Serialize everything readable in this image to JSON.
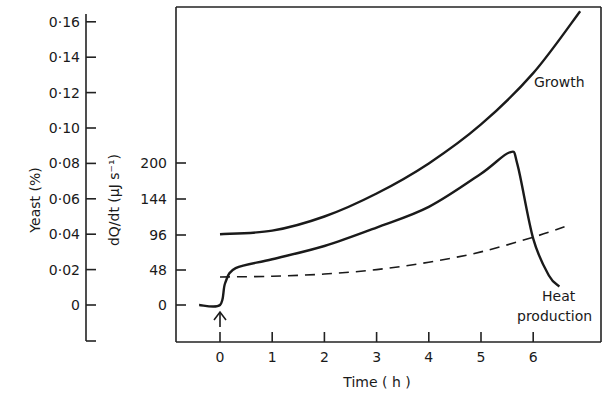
{
  "chart_data": {
    "type": "line",
    "title": "",
    "xlabel": "Time (h)",
    "x_ticks": [
      "0",
      "1",
      "2",
      "3",
      "4",
      "5",
      "6"
    ],
    "xlim": [
      -0.8,
      7.3
    ],
    "y_axes": [
      {
        "name": "yeast",
        "label": "Yeast (%)",
        "ticks": [
          "0·16",
          "0·14",
          "0·12",
          "0·10",
          "0·08",
          "0·06",
          "0·04",
          "0·02",
          "0"
        ],
        "ylim": [
          0,
          0.16
        ]
      },
      {
        "name": "heat",
        "label": "dQ/dt (μJ s⁻¹)",
        "ticks": [
          "200",
          "144",
          "96",
          "48",
          "0"
        ],
        "ylim": [
          0,
          200
        ]
      }
    ],
    "grid": false,
    "legend": "inline annotations",
    "series": [
      {
        "name": "Growth",
        "axis": "yeast",
        "style": "solid",
        "x": [
          0,
          1,
          2,
          3,
          4,
          5,
          6,
          6.9
        ],
        "values": [
          0.04,
          0.042,
          0.05,
          0.063,
          0.08,
          0.102,
          0.131,
          0.166
        ]
      },
      {
        "name": "Heat production",
        "axis": "heat",
        "style": "solid",
        "x": [
          -0.4,
          0,
          0.1,
          0.3,
          1,
          2,
          3,
          4,
          5,
          5.55,
          5.7,
          6.0,
          6.3,
          6.5
        ],
        "values": [
          0,
          0,
          30,
          50,
          62,
          80,
          105,
          133,
          178,
          207,
          190,
          90,
          40,
          25
        ]
      },
      {
        "name": "Yeast (dashed, lower)",
        "axis": "heat",
        "style": "dashed",
        "x": [
          0,
          1,
          2,
          3,
          4,
          5,
          6,
          6.6
        ],
        "values": [
          38,
          39,
          42,
          48,
          58,
          72,
          92,
          106
        ]
      }
    ],
    "annotations": [
      {
        "text": "Growth",
        "x": 6.1,
        "y_axis": "yeast",
        "y": 0.123
      },
      {
        "text": "Heat",
        "x": 6.2,
        "y_axis": "heat",
        "y": -10
      },
      {
        "text": "production",
        "x": 6.2,
        "y_axis": "heat",
        "y": -25
      },
      {
        "text": "↑",
        "x": 0,
        "note": "arrow marking time zero (addition)"
      }
    ]
  },
  "labels": {
    "x_title": "Time ( h )",
    "yeast_title": "Yeast (%)",
    "heat_title": "dQ/dt  (μJ s⁻¹)",
    "growth": "Growth",
    "heat_line1": "Heat",
    "heat_line2": "production"
  }
}
